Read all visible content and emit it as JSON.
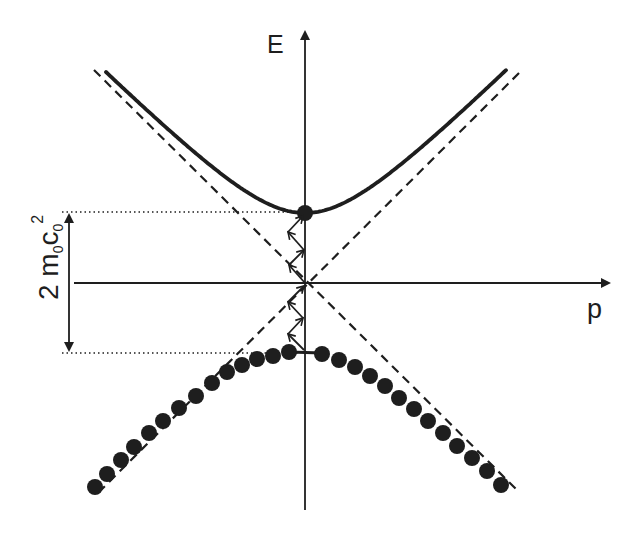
{
  "figure": {
    "type": "dispersion-relation",
    "labels": {
      "energy_axis": "E",
      "momentum_axis": "p",
      "gap": {
        "prefix": "2 m",
        "m_sub": "0",
        "c": "c",
        "c_sub": "0",
        "exp": "2"
      }
    },
    "colors": {
      "ink": "#1e1e1e",
      "background": "#ffffff"
    },
    "origin": [
      305,
      283
    ],
    "gap_half_px": 70,
    "upper_band": {
      "style": "solid",
      "x_range": [
        106,
        506
      ],
      "minimum": [
        305,
        213
      ]
    },
    "lower_band": {
      "style": "filled-circles",
      "maximum_y": 353,
      "dot_radius": 8,
      "dots": [
        [
          95,
          487
        ],
        [
          107,
          474
        ],
        [
          121,
          460
        ],
        [
          134,
          447
        ],
        [
          149,
          433
        ],
        [
          163,
          421
        ],
        [
          179,
          408
        ],
        [
          196,
          396
        ],
        [
          212,
          383
        ],
        [
          227,
          372
        ],
        [
          242,
          365
        ],
        [
          257,
          359
        ],
        [
          273,
          356
        ],
        [
          289,
          352
        ],
        [
          322,
          354
        ],
        [
          339,
          360
        ],
        [
          355,
          367
        ],
        [
          370,
          376
        ],
        [
          385,
          386
        ],
        [
          399,
          398
        ],
        [
          414,
          409
        ],
        [
          428,
          421
        ],
        [
          443,
          433
        ],
        [
          457,
          446
        ],
        [
          472,
          458
        ],
        [
          487,
          471
        ],
        [
          501,
          485
        ]
      ]
    },
    "asymptotes": {
      "style": "dashed",
      "lines": [
        [
          [
            94,
            70
          ],
          [
            517,
            490
          ]
        ],
        [
          [
            519,
            73
          ],
          [
            101,
            490
          ]
        ]
      ]
    },
    "transitions": {
      "upper_path": [
        [
          305,
          283
        ],
        [
          289,
          265
        ],
        [
          304,
          250
        ],
        [
          288,
          232
        ],
        [
          303,
          216
        ]
      ],
      "lower_path": [
        [
          304,
          350
        ],
        [
          288,
          334
        ],
        [
          303,
          318
        ],
        [
          288,
          302
        ],
        [
          304,
          286
        ]
      ]
    },
    "reference_lines": {
      "style": "dotted",
      "y_top": 212,
      "y_bottom": 353,
      "x_start": 62,
      "x_end": 300
    }
  }
}
